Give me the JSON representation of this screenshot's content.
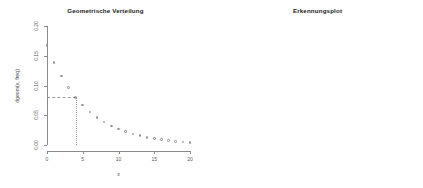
{
  "figure": {
    "background": "#ffffff",
    "axis_color": "#8a8a8a",
    "point_color": "#8f8f8f",
    "line_color": "#6f6f6f"
  },
  "panels": [
    {
      "id": "left",
      "title": "Geometrische Verteilung",
      "xlabel": "x",
      "ylabel": "dgeom(x, freq)"
    },
    {
      "id": "right",
      "title": "Erkennungsplot",
      "xlabel": "x",
      "ylabel": "log(dgeom(x, freq))"
    }
  ],
  "chart_data": [
    {
      "type": "scatter",
      "title": "Geometrische Verteilung",
      "xlabel": "x",
      "ylabel": "dgeom(x, freq)",
      "xlim": [
        0,
        20
      ],
      "ylim": [
        0.0,
        0.2
      ],
      "xticks": [
        0,
        5,
        10,
        15,
        20
      ],
      "xtick_labels": [
        "0",
        "5",
        "10",
        "15",
        "20"
      ],
      "yticks": [
        0.0,
        0.05,
        0.1,
        0.15,
        0.2
      ],
      "ytick_labels": [
        "0.00",
        "0.05",
        "0.10",
        "0.15",
        "0.20"
      ],
      "grid": false,
      "legend": false,
      "x": [
        0,
        1,
        2,
        3,
        4,
        5,
        6,
        7,
        8,
        9,
        10,
        11,
        12,
        13,
        14,
        15,
        16,
        17,
        18,
        19,
        20
      ],
      "values": [
        0.167,
        0.1391,
        0.1158,
        0.0965,
        0.0803,
        0.0669,
        0.0557,
        0.0464,
        0.0386,
        0.0322,
        0.0268,
        0.0223,
        0.0186,
        0.0155,
        0.0129,
        0.0107,
        0.0089,
        0.0074,
        0.0062,
        0.0052,
        0.0043
      ],
      "annotations": [
        {
          "kind": "horizontal-dashed-guide",
          "y": 0.0803,
          "x_from": 0,
          "x_to": 4
        },
        {
          "kind": "vertical-dotted-guide",
          "x": 4,
          "y_from": 0.0,
          "y_to": 0.0803
        }
      ]
    },
    {
      "type": "line",
      "title": "Erkennungsplot",
      "xlabel": "x",
      "ylabel": "log(dgeom(x, freq))",
      "xlim": [
        0,
        20
      ],
      "ylim": [
        -6.0,
        -1.0
      ],
      "xticks": [
        0,
        5,
        10,
        15,
        20
      ],
      "xtick_labels": [
        "0",
        "5",
        "10",
        "15",
        "20"
      ],
      "yticks": [
        -6,
        -5,
        -4,
        -3,
        -2,
        -1
      ],
      "ytick_labels": [
        "-6",
        "-5",
        "-4",
        "-3",
        "-2",
        "-1"
      ],
      "grid": false,
      "legend": false,
      "x": [
        0,
        1,
        2,
        3,
        4,
        5,
        6,
        7,
        8,
        9,
        10,
        11,
        12,
        13,
        14,
        15,
        16,
        17,
        18,
        19,
        20
      ],
      "values": [
        -1.79,
        -1.973,
        -2.155,
        -2.338,
        -2.521,
        -2.704,
        -2.887,
        -3.07,
        -3.252,
        -3.435,
        -3.618,
        -3.801,
        -3.984,
        -4.167,
        -4.349,
        -4.532,
        -4.715,
        -4.898,
        -5.081,
        -5.264,
        -5.446
      ],
      "fit_line": {
        "intercept": -1.79,
        "slope": -0.1828,
        "extends_beyond_axis": true
      }
    }
  ]
}
